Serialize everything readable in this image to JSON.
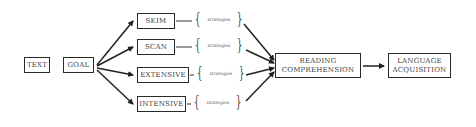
{
  "diagram": {
    "start_nodes": [
      {
        "id": "text",
        "label": "TEXT"
      },
      {
        "id": "goal",
        "label": "GOAL"
      }
    ],
    "connector_between_start": "·",
    "reading_types": [
      {
        "id": "skim",
        "label": "SKIM",
        "strategies_label": "strategies"
      },
      {
        "id": "scan",
        "label": "SCAN",
        "strategies_label": "strategies"
      },
      {
        "id": "extensive",
        "label": "EXTENSIVE",
        "strategies_label": "strategies"
      },
      {
        "id": "intensive",
        "label": "INTENSIVE",
        "strategies_label": "strategies"
      }
    ],
    "outcome_nodes": [
      {
        "id": "reading-comprehension",
        "line1": "READING",
        "line2": "COMPREHENSION"
      },
      {
        "id": "language-acquisition",
        "line1": "LANGUAGE",
        "line2": "ACQUISITION"
      }
    ],
    "edges": [
      {
        "from": "goal",
        "to": "skim"
      },
      {
        "from": "goal",
        "to": "scan"
      },
      {
        "from": "goal",
        "to": "extensive"
      },
      {
        "from": "goal",
        "to": "intensive"
      },
      {
        "from": "skim-strategies",
        "to": "reading-comprehension"
      },
      {
        "from": "scan-strategies",
        "to": "reading-comprehension"
      },
      {
        "from": "extensive-strategies",
        "to": "reading-comprehension"
      },
      {
        "from": "intensive-strategies",
        "to": "reading-comprehension"
      },
      {
        "from": "reading-comprehension",
        "to": "language-acquisition"
      }
    ],
    "colors": {
      "line": "#222222",
      "text": "#444444",
      "background": "#ffffff"
    }
  }
}
